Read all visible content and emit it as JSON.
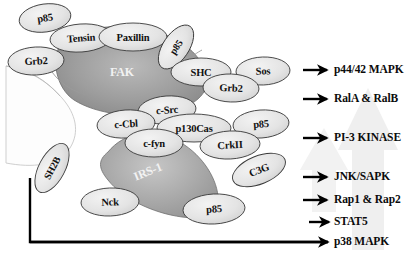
{
  "figure": {
    "colors": {
      "fak_fill_dark": "#8d8d8d",
      "fak_fill_light": "#b9b9b9",
      "irs_fill_dark": "#9a9a9a",
      "irs_fill_light": "#c6c6c6",
      "ellipse_fill": "#e2e2e2",
      "outline": "#3a3a3a",
      "text_dark": "#121212",
      "text_light": "#f2f2f2",
      "watermark": "#ededed",
      "arrow_black": "#000000"
    }
  },
  "big_shapes": [
    {
      "name": "FAK",
      "label": "FAK",
      "cx": 122,
      "cy": 72,
      "label_x": 122,
      "label_y": 72,
      "font_size": 12,
      "light_text": true
    },
    {
      "name": "IRS-1",
      "label": "IRS-1",
      "cx": 148,
      "cy": 172,
      "label_x": 148,
      "label_y": 172,
      "font_size": 12,
      "light_text": true,
      "rotation": -22
    }
  ],
  "nodes": [
    {
      "name": "p85-top-left",
      "label": "p85",
      "cx": 45,
      "cy": 18,
      "rx": 26,
      "ry": 14,
      "rotation": -8,
      "font_size": 10.5
    },
    {
      "name": "tensin",
      "label": "Tensin",
      "cx": 81,
      "cy": 38,
      "rx": 31,
      "ry": 14,
      "rotation": -4,
      "font_size": 10.5
    },
    {
      "name": "paxillin",
      "label": "Paxillin",
      "cx": 133,
      "cy": 37,
      "rx": 34,
      "ry": 14,
      "rotation": 0,
      "font_size": 10.5
    },
    {
      "name": "p85-top-right",
      "label": "p85",
      "cx": 176,
      "cy": 47,
      "rx": 25,
      "ry": 13,
      "rotation": -56,
      "font_size": 10
    },
    {
      "name": "grb2-left",
      "label": "Grb2",
      "cx": 36,
      "cy": 61,
      "rx": 28,
      "ry": 14,
      "rotation": -3,
      "font_size": 10.5
    },
    {
      "name": "shc",
      "label": "SHC",
      "cx": 201,
      "cy": 72,
      "rx": 30,
      "ry": 14,
      "rotation": 0,
      "font_size": 10.5
    },
    {
      "name": "sos",
      "label": "Sos",
      "cx": 263,
      "cy": 71,
      "rx": 27,
      "ry": 14,
      "rotation": -2,
      "font_size": 10.5
    },
    {
      "name": "grb2-right",
      "label": "Grb2",
      "cx": 231,
      "cy": 88,
      "rx": 28,
      "ry": 14,
      "rotation": 2,
      "font_size": 10.5
    },
    {
      "name": "c-src",
      "label": "c-Src",
      "cx": 167,
      "cy": 110,
      "rx": 29,
      "ry": 14,
      "rotation": -4,
      "font_size": 10.5
    },
    {
      "name": "c-cbl",
      "label": "c-Cbl",
      "cx": 126,
      "cy": 124,
      "rx": 29,
      "ry": 14,
      "rotation": -4,
      "font_size": 10.5
    },
    {
      "name": "p130cas",
      "label": "p130Cas",
      "cx": 194,
      "cy": 128,
      "rx": 37,
      "ry": 14,
      "rotation": 0,
      "font_size": 10.5
    },
    {
      "name": "c-fyn",
      "label": "c-fyn",
      "cx": 154,
      "cy": 143,
      "rx": 29,
      "ry": 14,
      "rotation": 0,
      "font_size": 10.5
    },
    {
      "name": "p85-mid-right",
      "label": "p85",
      "cx": 261,
      "cy": 124,
      "rx": 28,
      "ry": 14,
      "rotation": -4,
      "font_size": 10.5
    },
    {
      "name": "crkii",
      "label": "CrkII",
      "cx": 230,
      "cy": 145,
      "rx": 30,
      "ry": 14,
      "rotation": -3,
      "font_size": 10.5
    },
    {
      "name": "c3g",
      "label": "C3G",
      "cx": 259,
      "cy": 170,
      "rx": 28,
      "ry": 14,
      "rotation": -22,
      "font_size": 10.5
    },
    {
      "name": "sh2b",
      "label": "SH2B",
      "cx": 52,
      "cy": 168,
      "rx": 27,
      "ry": 13,
      "rotation": -62,
      "font_size": 10
    },
    {
      "name": "nck",
      "label": "Nck",
      "cx": 110,
      "cy": 202,
      "rx": 29,
      "ry": 14,
      "rotation": -2,
      "font_size": 10.5
    },
    {
      "name": "p85-bottom",
      "label": "p85",
      "cx": 214,
      "cy": 209,
      "rx": 31,
      "ry": 15,
      "rotation": -3,
      "font_size": 10.5
    }
  ],
  "outputs": [
    {
      "name": "output-p44-42-mapk",
      "label": "p44/42 MAPK",
      "arrow_x": 303,
      "arrow_y": 70,
      "arrow_len": 24,
      "text_x": 334,
      "text_y": 70
    },
    {
      "name": "output-rala-ralb",
      "label": "RalA & RalB",
      "arrow_x": 303,
      "arrow_y": 99,
      "arrow_len": 24,
      "text_x": 334,
      "text_y": 99
    },
    {
      "name": "output-pi3-kinase",
      "label": "PI-3 KINASE",
      "arrow_x": 303,
      "arrow_y": 138,
      "arrow_len": 24,
      "text_x": 334,
      "text_y": 138
    },
    {
      "name": "output-jnk-sapk",
      "label": "JNK/SAPK",
      "arrow_x": 303,
      "arrow_y": 177,
      "arrow_len": 24,
      "text_x": 334,
      "text_y": 177
    },
    {
      "name": "output-rap1-rap2",
      "label": "Rap1 & Rap2",
      "arrow_x": 303,
      "arrow_y": 200,
      "arrow_len": 24,
      "text_x": 334,
      "text_y": 200
    },
    {
      "name": "output-stat5",
      "label": "STAT5",
      "arrow_x": 309,
      "arrow_y": 222,
      "arrow_len": 20,
      "text_x": 334,
      "text_y": 222
    },
    {
      "name": "output-p38-mapk",
      "label": "p38 MAPK",
      "arrow_x": 30,
      "arrow_y": 242,
      "arrow_len": 298,
      "text_x": 334,
      "text_y": 242
    }
  ],
  "connector": {
    "name": "sh2b-to-p38-connector",
    "description": "L-shaped line from SH2B down and across to p38 MAPK arrow",
    "start_x": 30,
    "start_y": 178,
    "corner_x": 30,
    "corner_y": 242,
    "end_x": 328,
    "end_y": 242
  }
}
